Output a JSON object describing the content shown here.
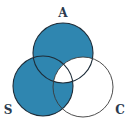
{
  "diagram": {
    "type": "venn",
    "sets": [
      {
        "name": "A",
        "label": "A",
        "cx": 63,
        "cy": 53,
        "r": 30
      },
      {
        "name": "S",
        "label": "S",
        "cx": 43,
        "cy": 86,
        "r": 30
      },
      {
        "name": "C",
        "label": "C",
        "cx": 83,
        "cy": 87,
        "r": 30
      }
    ],
    "shaded_regions": [
      "A only",
      "S only",
      "A∩S only",
      "S∩C only"
    ],
    "unshaded_regions": [
      "A∩S∩C",
      "A∩C only",
      "C only"
    ],
    "colors": {
      "fill": "#2f86b0",
      "outline": "#1e2c38",
      "background": "#ffffff",
      "label": "#2a3a4e"
    }
  },
  "labels": {
    "a": "A",
    "s": "S",
    "c": "C"
  }
}
